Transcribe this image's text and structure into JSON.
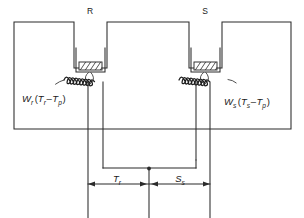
{
  "figure": {
    "type": "schematic-diagram",
    "cells": [
      {
        "id": "reference",
        "label": "R",
        "side": "left"
      },
      {
        "id": "sample",
        "label": "S",
        "side": "right"
      }
    ],
    "equations": {
      "left": {
        "symbol": "W",
        "symbol_sub": "r",
        "open": "(",
        "term1": "T",
        "term1_sub": "r",
        "minus": "–",
        "term2": "T",
        "term2_sub": "p",
        "close": ")",
        "plain": "Wr (Tr – Tp)"
      },
      "right": {
        "symbol": "W",
        "symbol_sub": "s",
        "open": "(",
        "term1": "T",
        "term1_sub": "s",
        "minus": "–",
        "term2": "T",
        "term2_sub": "p",
        "close": ")",
        "plain": "Ws (Ts – Tp)"
      }
    },
    "dimensions": [
      {
        "id": "left-dim",
        "symbol": "T",
        "symbol_sub": "r",
        "plain": "Tr"
      },
      {
        "id": "right-dim",
        "symbol": "S",
        "symbol_sub": "s",
        "plain": "Ss"
      }
    ],
    "elements": {
      "pan_fill": "hatched",
      "coil_count": 2,
      "lead_count": 4,
      "center_tap": true
    },
    "colors": {
      "stroke": "#2b2b2b",
      "coil": "#1d1d1d",
      "text": "#1a1a1a",
      "background": "#ffffff"
    }
  }
}
